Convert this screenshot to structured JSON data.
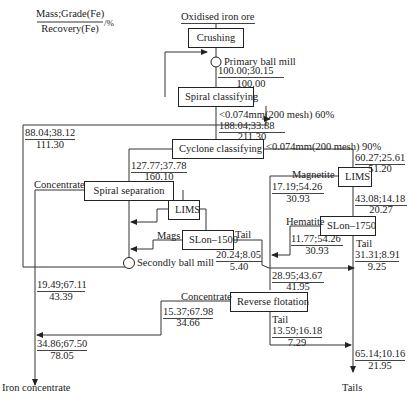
{
  "legend": {
    "numerator": "Mass;Grade(Fe)",
    "denominator": "Recovery(Fe)",
    "unit": "/%"
  },
  "feed": "Oxidised iron ore",
  "units": {
    "crushing": "Crushing",
    "primary_ball_mill": "Primary ball mill",
    "spiral_classifying": "Spiral classifying",
    "cyclone_classifying": "Cyclone classifying",
    "spiral_separation": "Spiral separation",
    "lims_1": "LIMS",
    "slon_1500": "SLon–1500",
    "secondly_ball_mill": "Secondly ball mill",
    "lims_2": "LIMS",
    "slon_1750": "SLon–1750",
    "reverse_flotation": "Reverse flotation"
  },
  "labels": {
    "spiral_overflow": "<0.074mm(200 mesh) 60%",
    "cyclone_overflow": "<0.074mm(200 mesh) 90%",
    "concentrate_spiral": "Concentrate",
    "mags": "Mags",
    "tail_slon1500": "Tail",
    "magnetite": "Magnetite",
    "hematite": "Hematite",
    "tail_slon1750": "Tail",
    "concentrate_rf": "Concentrate",
    "tail_rf": "Tail",
    "iron_concentrate": "Iron concentrate",
    "tails": "Tails"
  },
  "streams": {
    "primary_mill": {
      "mg": "100.00;30.15",
      "r": "100.00"
    },
    "spiral_overflow": {
      "mg": "188.04;33.88",
      "r": "211.30"
    },
    "spiral_underflow": {
      "mg": "88.04;38.12",
      "r": "111.30"
    },
    "cyclone_underflow": {
      "mg": "127.77;37.78",
      "r": "160.10"
    },
    "cyclone_overflow": {
      "mg": "60.27;25.61",
      "r": "51.20"
    },
    "magnetite": {
      "mg": "17.19;54.26",
      "r": "30.93"
    },
    "lims2_tail": {
      "mg": "43.08;14.18",
      "r": "20.27"
    },
    "hematite": {
      "mg": "11.77;54.26",
      "r": "30.93"
    },
    "slon1750_tail": {
      "mg": "31.31;8.91",
      "r": "9.25"
    },
    "slon1500_tail": {
      "mg": "20.24;8.05",
      "r": "5.40"
    },
    "rf_feed": {
      "mg": "28.95;43.67",
      "r": "41.95"
    },
    "spiral_conc": {
      "mg": "19.49;67.11",
      "r": "43.39"
    },
    "rf_conc": {
      "mg": "15.37;67.98",
      "r": "34.66"
    },
    "rf_tail": {
      "mg": "13.59;16.18",
      "r": "7.29"
    },
    "final_conc": {
      "mg": "34.86;67.50",
      "r": "78.05"
    },
    "final_tails": {
      "mg": "65.14;10.16",
      "r": "21.95"
    }
  }
}
